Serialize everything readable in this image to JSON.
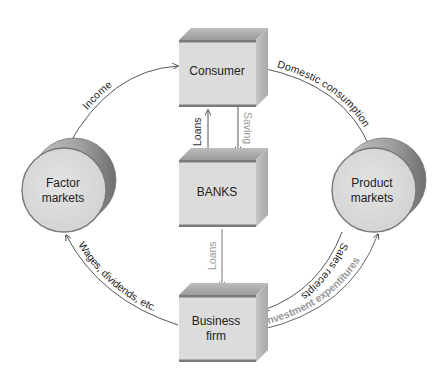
{
  "diagram": {
    "nodes": {
      "consumer": {
        "label": "Consumer",
        "shape": "box"
      },
      "banks": {
        "label": "BANKS",
        "shape": "box"
      },
      "business": {
        "label_line1": "Business",
        "label_line2": "firm",
        "shape": "box"
      },
      "factor_markets": {
        "label_line1": "Factor",
        "label_line2": "markets",
        "shape": "cylinder"
      },
      "product_markets": {
        "label_line1": "Product",
        "label_line2": "markets",
        "shape": "cylinder"
      }
    },
    "flows": {
      "income": {
        "label": "Income",
        "from": "Factor markets",
        "to": "Consumer"
      },
      "domestic_consumption": {
        "label": "Domestic consumption",
        "from": "Consumer",
        "to": "Product markets"
      },
      "loans_to_consumer": {
        "label": "Loans",
        "from": "BANKS",
        "to": "Consumer"
      },
      "saving": {
        "label": "Saving",
        "from": "Consumer",
        "to": "BANKS"
      },
      "loans_to_business": {
        "label": "Loans",
        "from": "BANKS",
        "to": "Business firm"
      },
      "sales_receipts": {
        "label": "Sales receipts",
        "from": "Product markets",
        "to": "Business firm"
      },
      "investment_expenditures": {
        "label": "Investment expentitures",
        "from": "Business firm",
        "to": "Product markets"
      },
      "wages": {
        "label": "Wages, dividends, etc.",
        "from": "Business firm",
        "to": "Factor markets"
      }
    },
    "colors": {
      "box_front": "#dcdcdc",
      "box_top": "#a9a9a9",
      "box_side": "#b8b8b8",
      "box_band": "#7a7a7a",
      "cylinder_face": "#d8d8d8",
      "cylinder_rim": "#9a9a9a",
      "line": "#444444",
      "gray_text": "#9a9a9a"
    }
  }
}
